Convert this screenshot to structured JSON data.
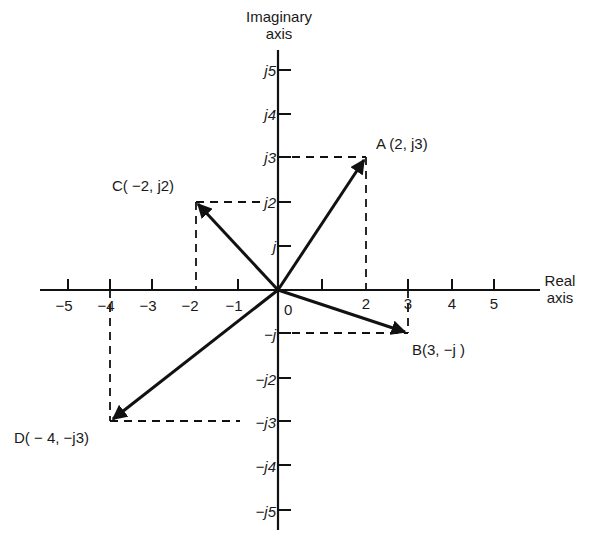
{
  "diagram": {
    "type": "argand-diagram",
    "axes": {
      "imaginary_title_line1": "Imaginary",
      "imaginary_title_line2": "axis",
      "real_title_line1": "Real",
      "real_title_line2": "axis",
      "origin_label": "0"
    },
    "real_ticks": [
      "−5",
      "−4",
      "−3",
      "−2",
      "−1",
      "2",
      "3",
      "4",
      "5"
    ],
    "imag_ticks": {
      "p5": "j5",
      "p4": "j4",
      "p3": "j3",
      "p2": "j2",
      "p1": "j",
      "m1": "−j",
      "m2": "−j2",
      "m3": "−j3",
      "m4": "−j4",
      "m5": "−j5"
    },
    "points": [
      {
        "name": "A",
        "label": "A (2, j3)",
        "re": 2,
        "im": 3
      },
      {
        "name": "B",
        "label": "B(3, −j )",
        "re": 3,
        "im": -1
      },
      {
        "name": "C",
        "label": "C( −2, j2)",
        "re": -2,
        "im": 2
      },
      {
        "name": "D",
        "label": "D( − 4, −j3)",
        "re": -4,
        "im": -3
      }
    ],
    "colors": {
      "line": "#111111",
      "background": "#ffffff"
    }
  }
}
